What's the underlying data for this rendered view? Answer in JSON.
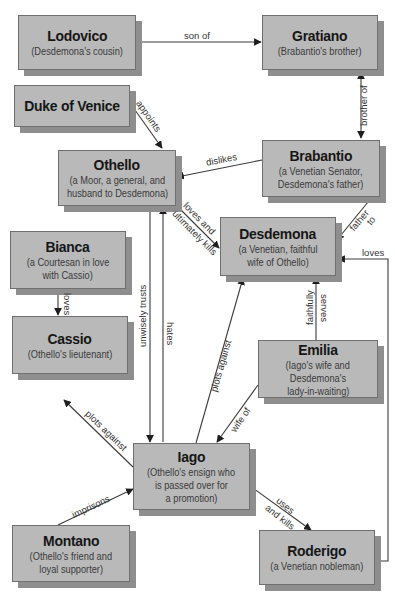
{
  "diagram": {
    "type": "character relationship map",
    "nodes": {
      "lodovico": {
        "name": "Lodovico",
        "desc": [
          "(Desdemona's cousin)"
        ]
      },
      "gratiano": {
        "name": "Gratiano",
        "desc": [
          "(Brabantio's brother)"
        ]
      },
      "duke": {
        "name": "Duke of Venice",
        "desc": []
      },
      "othello": {
        "name": "Othello",
        "desc": [
          "(a Moor, a general, and",
          "husband to Desdemona)"
        ]
      },
      "brabantio": {
        "name": "Brabantio",
        "desc": [
          "(a Venetian Senator,",
          "Desdemona's father)"
        ]
      },
      "desdemona": {
        "name": "Desdemona",
        "desc": [
          "(a Venetian, faithful",
          "wife of Othello)"
        ]
      },
      "bianca": {
        "name": "Bianca",
        "desc": [
          "(a Courtesan in love",
          "with Cassio)"
        ]
      },
      "cassio": {
        "name": "Cassio",
        "desc": [
          "(Othello's lieutenant)"
        ]
      },
      "emilia": {
        "name": "Emilia",
        "desc": [
          "(Iago's wife and",
          "Desdemona's",
          "lady-in-waiting)"
        ]
      },
      "iago": {
        "name": "Iago",
        "desc": [
          "(Othello's ensign who",
          "is passed over for",
          "a promotion)"
        ]
      },
      "montano": {
        "name": "Montano",
        "desc": [
          "(Othello's friend and",
          "loyal supporter)"
        ]
      },
      "roderigo": {
        "name": "Roderigo",
        "desc": [
          "(a Venetian nobleman)"
        ]
      }
    },
    "edges": {
      "son_of": {
        "from": "Lodovico",
        "to": "Gratiano",
        "label": "son of"
      },
      "brother_of": {
        "from": "Gratiano",
        "to": "Brabantio",
        "label": "brother of",
        "bidirectional": true
      },
      "appoints": {
        "from": "Duke of Venice",
        "to": "Othello",
        "label": "appoints"
      },
      "dislikes": {
        "from": "Brabantio",
        "to": "Othello",
        "label": "dislikes"
      },
      "father_to": {
        "from": "Brabantio",
        "to": "Desdemona",
        "label_line1": "father",
        "label_line2": "to"
      },
      "loves_kills": {
        "from": "Othello",
        "to": "Desdemona",
        "label_line1": "loves and",
        "label_line2": "ultimately kills"
      },
      "unwisely_trusts": {
        "from": "Othello",
        "to": "Iago",
        "label": "unwisely trusts"
      },
      "hates": {
        "from": "Iago",
        "to": "Othello",
        "label": "hates"
      },
      "bianca_loves": {
        "from": "Bianca",
        "to": "Cassio",
        "label": "loves"
      },
      "plots_against_desdemona": {
        "from": "Iago",
        "to": "Desdemona",
        "label": "plots against"
      },
      "faithfully_serves": {
        "from": "Emilia",
        "to": "Desdemona",
        "label_line1": "faithfully",
        "label_line2": "serves"
      },
      "wife_of": {
        "from": "Emilia",
        "to": "Iago",
        "label": "wife of"
      },
      "plots_against_cassio": {
        "from": "Iago",
        "to": "Cassio",
        "label": "plots against"
      },
      "imprisons": {
        "from": "Montano",
        "to": "Iago",
        "label": "imprisons"
      },
      "uses_kills": {
        "from": "Iago",
        "to": "Roderigo",
        "label_line1": "uses",
        "label_line2": "and kills"
      },
      "roderigo_loves": {
        "from": "Roderigo",
        "to": "Desdemona",
        "label": "loves"
      }
    },
    "colors": {
      "box_fill": "#b9b9b9",
      "box_shadow": "#8e8e8e",
      "line": "#2a2a2a",
      "text": "#161616"
    }
  }
}
